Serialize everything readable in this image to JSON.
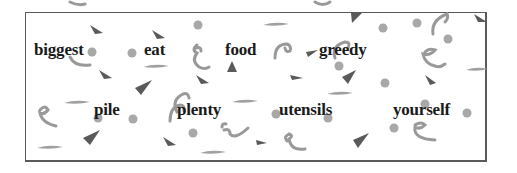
{
  "word_bank": {
    "row1": [
      "biggest",
      "eat",
      "food",
      "greedy"
    ],
    "row2": [
      "pile",
      "plenty",
      "utensils",
      "yourself"
    ]
  },
  "colors": {
    "border": "#5a5a5a",
    "text": "#1a1a1a",
    "confetti_dark": "#555555",
    "confetti_light": "#a8a8a8"
  }
}
